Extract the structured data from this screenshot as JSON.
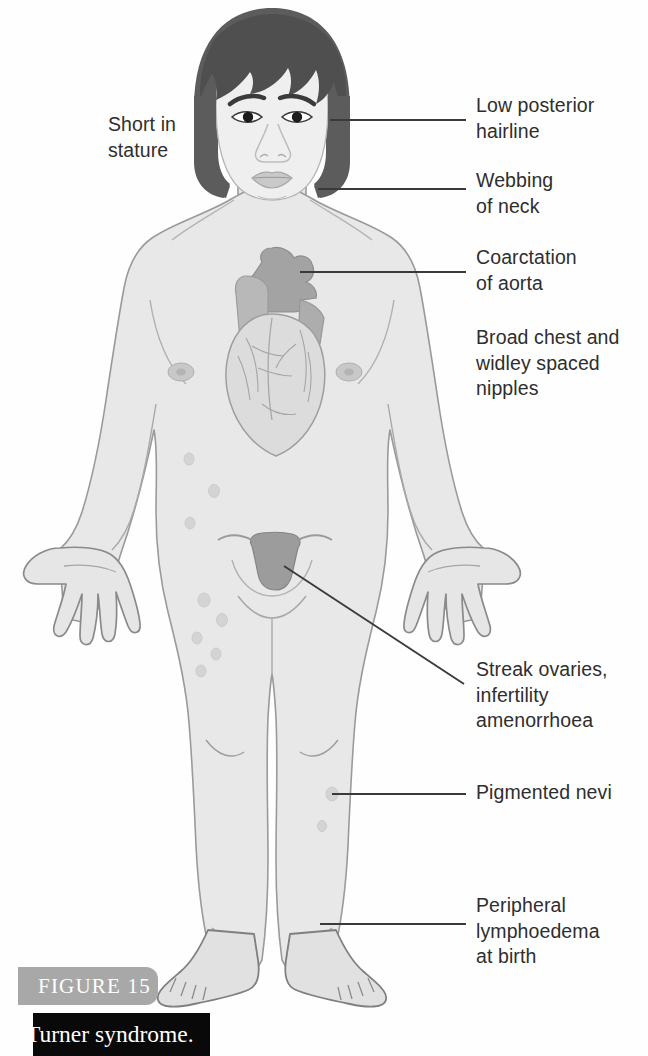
{
  "figure": {
    "tag_label": "FIGURE 15",
    "caption": "Turner syndrome.",
    "tag_color": "#a8a8a8",
    "caption_bg": "#090909"
  },
  "annotations": {
    "short_stature": "Short in\nstature",
    "low_posterior_hairline": "Low posterior\nhairline",
    "webbing_of_neck": "Webbing\nof neck",
    "coarctation_of_aorta": "Coarctation\nof aorta",
    "broad_chest": "Broad chest and\nwidley spaced\nnipples",
    "streak_ovaries": "Streak ovaries,\ninfertility\namenorrhoea",
    "pigmented_nevi": "Pigmented nevi",
    "peripheral_lymphoedema": "Peripheral\nlymphoedema\nat birth"
  },
  "illustration": {
    "subject": "female-figure-turner-syndrome",
    "parts": [
      "hair",
      "face",
      "eyes",
      "eyebrows",
      "nose",
      "mouth",
      "neck",
      "torso",
      "nipples",
      "heart",
      "aorta",
      "arms",
      "hands",
      "uterus",
      "legs",
      "knees",
      "feet",
      "nevi-spots"
    ],
    "colors": {
      "hair": "#5c5c5c",
      "skin_fill": "#e8e8e8",
      "skin_outline": "#9a9a9a",
      "face_fill": "#efefef",
      "heart_light": "#d8d8d8",
      "heart_dark": "#a0a0a0",
      "uterus": "#9e9e9e",
      "nipple": "#c2c2c2",
      "nevus": "#d2d2d2",
      "leader_line": "#3a3a3a",
      "background": "#fefefe"
    }
  }
}
